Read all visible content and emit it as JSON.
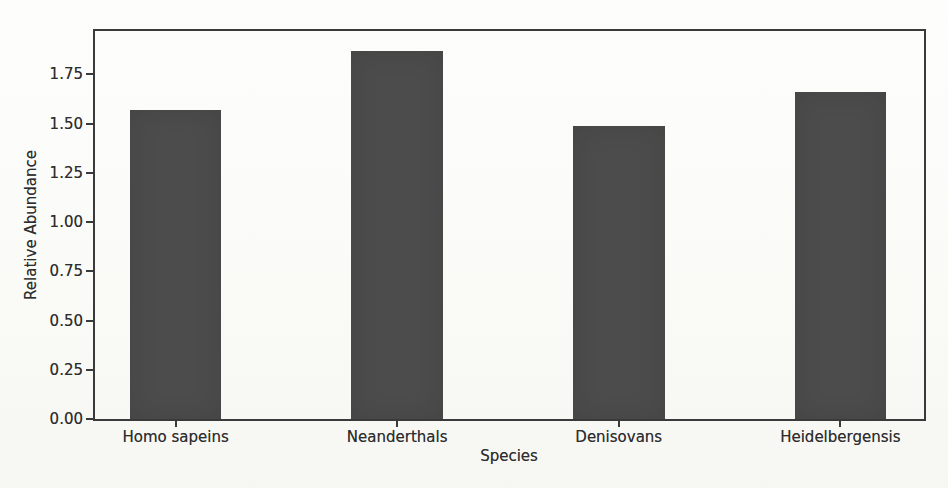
{
  "chart_data": {
    "type": "bar",
    "title": "",
    "xlabel": "Species",
    "ylabel": "Relative Abundance",
    "categories": [
      "Homo sapeins",
      "Neanderthals",
      "Denisovans",
      "Heidelbergensis"
    ],
    "values": [
      1.57,
      1.87,
      1.49,
      1.66
    ],
    "ylim": [
      0,
      1.97
    ],
    "yticks": [
      "0.00",
      "0.25",
      "0.50",
      "0.75",
      "1.00",
      "1.25",
      "1.50",
      "1.75"
    ],
    "grid": false,
    "legend": false,
    "bar_color": "#4c4c4c",
    "axis_color": "#3a3a3a",
    "text_color": "#2d2d2d",
    "background_color": "#fbfbf9"
  }
}
